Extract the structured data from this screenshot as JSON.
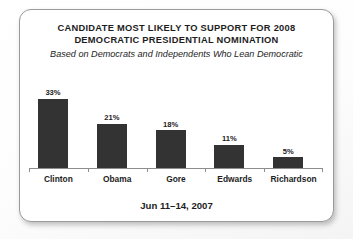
{
  "card": {
    "title_lines": [
      "CANDIDATE MOST LIKELY TO SUPPORT FOR 2008",
      "DEMOCRATIC PRESIDENTIAL NOMINATION"
    ],
    "subtitle": "Based on Democrats and Independents Who Lean Democratic",
    "footer": "Jun 11–14, 2007"
  },
  "colors": {
    "bar": "#333333",
    "axis": "#8d8d8d",
    "text": "#1d1d1d",
    "card_border": "#9a9a9a",
    "card_background": "#ffffff"
  },
  "chart_data": {
    "type": "bar",
    "title": "CANDIDATE MOST LIKELY TO SUPPORT FOR 2008 DEMOCRATIC PRESIDENTIAL NOMINATION",
    "subtitle": "Based on Democrats and Independents Who Lean Democratic",
    "footnote": "Jun 11–14, 2007",
    "categories": [
      "Clinton",
      "Obama",
      "Gore",
      "Edwards",
      "Richardson"
    ],
    "values": [
      33,
      21,
      18,
      11,
      5
    ],
    "data_labels": [
      "33%",
      "21%",
      "18%",
      "11%",
      "5%"
    ],
    "xlabel": "",
    "ylabel": "",
    "ylim": [
      0,
      38
    ],
    "unit": "%",
    "grid": false,
    "legend": false,
    "axis": "x-axis only, with ticks at category boundaries"
  }
}
